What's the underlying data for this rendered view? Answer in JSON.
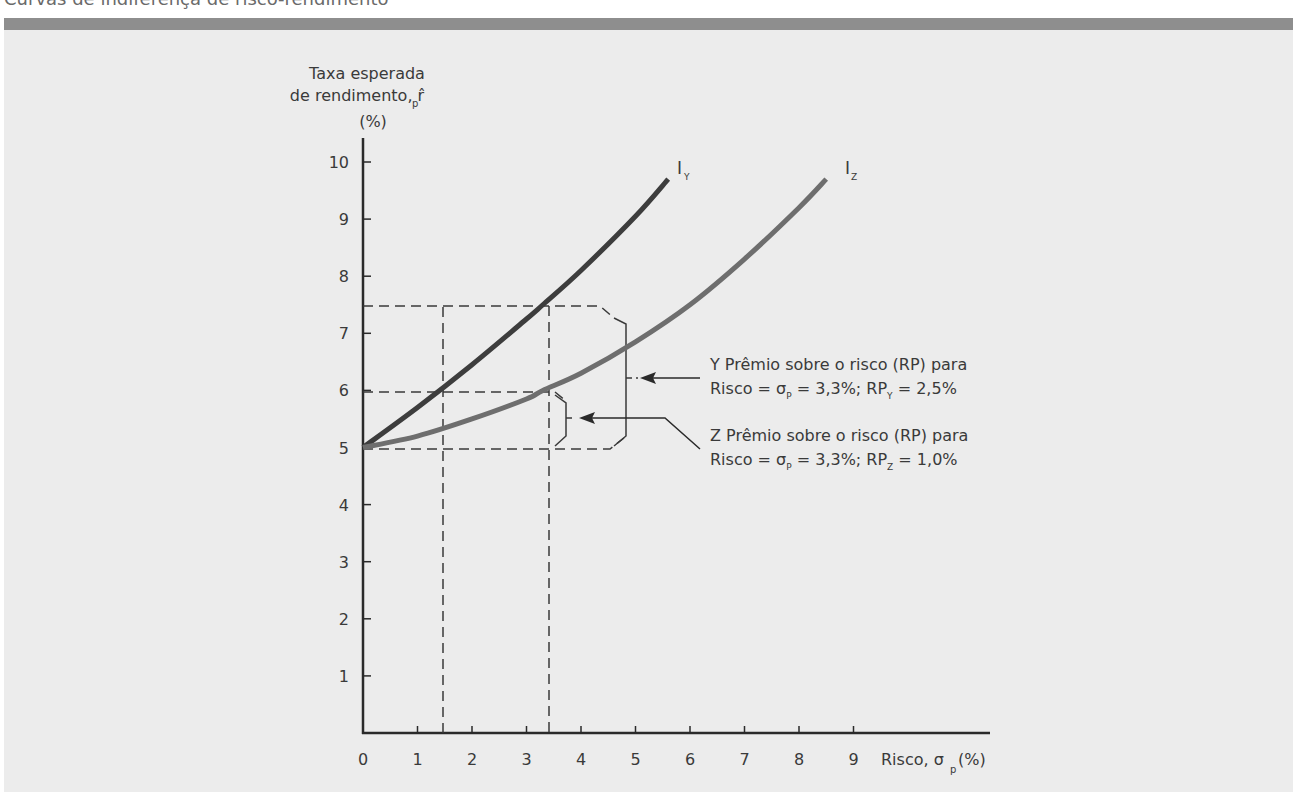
{
  "page": {
    "title": "Curvas de indiferença de risco-rendimento"
  },
  "colors": {
    "background": "#ececec",
    "title_bar": "#8e8e8e",
    "curve_Y": "#3d3d3d",
    "curve_Z": "#6e6e6e",
    "axis": "#2a2a2a",
    "text": "#3a3a3a"
  },
  "chart_data": {
    "type": "line",
    "title": "Curvas de indiferença de risco-rendimento",
    "xlabel": "Risco, σp (%)",
    "ylabel": "Taxa esperada de rendimento, r̂p (%)",
    "ylabel_lines": [
      "Taxa esperada",
      "de rendimento, r̂",
      "(%)"
    ],
    "xlim": [
      0,
      10
    ],
    "ylim": [
      0,
      10
    ],
    "x_ticks": [
      "0",
      "1",
      "2",
      "3",
      "4",
      "5",
      "6",
      "7",
      "8",
      "9"
    ],
    "y_ticks": [
      "1",
      "2",
      "3",
      "4",
      "5",
      "6",
      "7",
      "8",
      "9",
      "10"
    ],
    "grid": false,
    "series": [
      {
        "name": "IY",
        "label": "I",
        "label_sub": "Y",
        "x": [
          0,
          1,
          2,
          3,
          3.3,
          4,
          5,
          5.6
        ],
        "y": [
          5.0,
          5.7,
          6.45,
          7.25,
          7.5,
          8.1,
          9.05,
          9.7
        ]
      },
      {
        "name": "IZ",
        "label": "I",
        "label_sub": "Z",
        "x": [
          0,
          1,
          2,
          3,
          3.3,
          4,
          5,
          6,
          7,
          8,
          8.5
        ],
        "y": [
          5.0,
          5.2,
          5.5,
          5.85,
          6.0,
          6.3,
          6.85,
          7.5,
          8.3,
          9.2,
          9.7
        ]
      }
    ],
    "reference_lines": {
      "horizontal": [
        5.0,
        6.0,
        7.5
      ],
      "vertical": [
        1.4,
        3.3
      ]
    },
    "annotations": [
      {
        "id": "Y",
        "line1": "Y Prêmio sobre o risco (RP) para",
        "line2_parts": [
          "Risco = σ",
          "P",
          " = 3,3%; RP",
          "Y",
          " = 2,5%"
        ],
        "sigma": 3.3,
        "risk_premium": 2.5
      },
      {
        "id": "Z",
        "line1": "Z Prêmio sobre o risco (RP) para",
        "line2_parts": [
          "Risco = σ",
          "P",
          " = 3,3%; RP",
          "Z",
          " = 1,0%"
        ],
        "sigma": 3.3,
        "risk_premium": 1.0
      }
    ],
    "x_axis_label_parts": [
      "Risco, σ",
      "p",
      "(%)"
    ],
    "y_axis_label_sub": "p"
  }
}
